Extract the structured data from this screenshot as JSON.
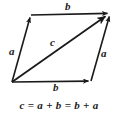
{
  "figure": {
    "background_color": "#ffffff",
    "stroke_color": "#1a1a1a",
    "equation": "c = a + b = b + a",
    "labels": {
      "b_top": "b",
      "b_bottom": "b",
      "a_left": "a",
      "a_right": "a",
      "c_diagonal": "c"
    },
    "vectors": [
      {
        "name": "a-left",
        "label": "a",
        "from": [
          12,
          82
        ],
        "to": [
          31,
          15
        ],
        "arrowhead": "to"
      },
      {
        "name": "b-top",
        "label": "b",
        "from": [
          31,
          15
        ],
        "to": [
          110,
          13
        ],
        "arrowhead": "to"
      },
      {
        "name": "b-bottom",
        "label": "b",
        "from": [
          12,
          82
        ],
        "to": [
          91,
          81
        ],
        "arrowhead": "to"
      },
      {
        "name": "a-right",
        "label": "a",
        "from": [
          91,
          81
        ],
        "to": [
          110,
          13
        ],
        "arrowhead": "to"
      },
      {
        "name": "c-diagonal",
        "label": "c",
        "from": [
          12,
          82
        ],
        "to": [
          110,
          13
        ],
        "arrowhead": "to"
      }
    ],
    "vertices": {
      "origin": [
        12,
        82
      ],
      "top_left": [
        31,
        15
      ],
      "top_right": [
        110,
        13
      ],
      "bottom_right": [
        91,
        81
      ]
    }
  }
}
